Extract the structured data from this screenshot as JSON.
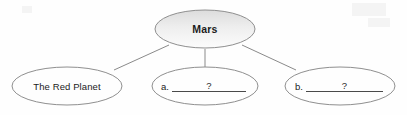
{
  "worksheet": {
    "background_color": "#fefefe",
    "ink_color": "#6f6f6f",
    "text_color": "#1c1c1c",
    "rule_color": "#4a4a4a"
  },
  "diagram": {
    "type": "concept-map",
    "root": {
      "id": "mars",
      "label": "Mars",
      "shape": "ellipse",
      "fill": "gradient-gray-to-white",
      "cx": 205,
      "cy": 29,
      "rx": 50,
      "ry": 19
    },
    "children": [
      {
        "id": "red-planet",
        "label": "The Red Planet",
        "shape": "ellipse",
        "filled": false,
        "cx": 67,
        "cy": 86,
        "rx": 55,
        "ry": 19
      },
      {
        "id": "blank-a",
        "prefix": "a.",
        "answer": "",
        "placeholder_mark": "?",
        "shape": "ellipse",
        "filled": false,
        "cx": 205,
        "cy": 86,
        "rx": 53,
        "ry": 19
      },
      {
        "id": "blank-b",
        "prefix": "b.",
        "answer": "",
        "placeholder_mark": "?",
        "shape": "ellipse",
        "filled": false,
        "cx": 340,
        "cy": 86,
        "rx": 55,
        "ry": 19
      }
    ],
    "connectors": [
      {
        "from": "mars",
        "to": "red-planet",
        "x1": 169,
        "y1": 45,
        "x2": 114,
        "y2": 70
      },
      {
        "from": "mars",
        "to": "blank-a",
        "x1": 205,
        "y1": 49,
        "x2": 205,
        "y2": 67
      },
      {
        "from": "mars",
        "to": "blank-b",
        "x1": 242,
        "y1": 45,
        "x2": 296,
        "y2": 70
      }
    ]
  }
}
